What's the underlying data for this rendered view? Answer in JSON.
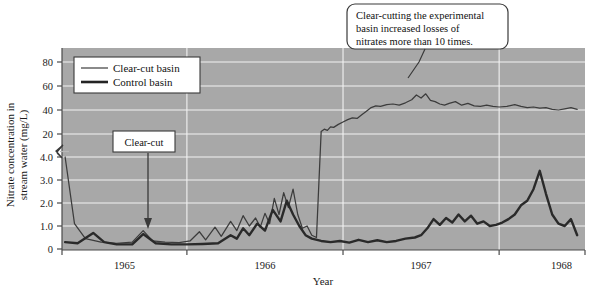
{
  "chart_data": {
    "type": "line",
    "title": "",
    "xlabel": "Year",
    "ylabel_line1": "Nitrate concentration in",
    "ylabel_line2": "stream water (mg/L)",
    "x_tick_labels": [
      "1965",
      "1966",
      "1967",
      "1968"
    ],
    "y_tick_labels_lower": [
      "0",
      "1.0",
      "2.0",
      "3.0",
      "4.0"
    ],
    "y_tick_labels_upper": [
      "20",
      "40",
      "60",
      "80"
    ],
    "y_axis_break": true,
    "y_axis_break_note": "broken axis: lower segment 0-4.0 mg/L, upper segment 20-80 mg/L",
    "grid": true,
    "legend_position": "upper-left-inside",
    "xlim_years": [
      1964.7,
      1968.05
    ],
    "series": [
      {
        "name": "Clear-cut basin",
        "style": "thin",
        "color": "#3c3c3c",
        "points": [
          [
            1964.72,
            4.0
          ],
          [
            1964.78,
            1.1
          ],
          [
            1964.85,
            0.45
          ],
          [
            1964.95,
            0.3
          ],
          [
            1965.05,
            0.25
          ],
          [
            1965.15,
            0.3
          ],
          [
            1965.22,
            0.8
          ],
          [
            1965.28,
            0.35
          ],
          [
            1965.36,
            0.3
          ],
          [
            1965.45,
            0.28
          ],
          [
            1965.52,
            0.35
          ],
          [
            1965.58,
            0.75
          ],
          [
            1965.62,
            0.4
          ],
          [
            1965.68,
            0.95
          ],
          [
            1965.72,
            0.55
          ],
          [
            1965.78,
            1.2
          ],
          [
            1965.82,
            0.8
          ],
          [
            1965.86,
            1.45
          ],
          [
            1965.9,
            1.0
          ],
          [
            1965.94,
            1.35
          ],
          [
            1965.97,
            0.95
          ],
          [
            1966.0,
            1.55
          ],
          [
            1966.03,
            1.1
          ],
          [
            1966.06,
            2.2
          ],
          [
            1966.09,
            1.5
          ],
          [
            1966.12,
            2.45
          ],
          [
            1966.15,
            1.8
          ],
          [
            1966.18,
            2.6
          ],
          [
            1966.21,
            1.5
          ],
          [
            1966.24,
            0.9
          ],
          [
            1966.27,
            1.0
          ],
          [
            1966.3,
            0.6
          ],
          [
            1966.33,
            0.5
          ],
          [
            1966.36,
            22.0
          ],
          [
            1966.38,
            24.0
          ],
          [
            1966.4,
            23.0
          ],
          [
            1966.42,
            26.0
          ],
          [
            1966.44,
            25.5
          ],
          [
            1966.47,
            28.0
          ],
          [
            1966.5,
            30.0
          ],
          [
            1966.53,
            32.0
          ],
          [
            1966.56,
            33.5
          ],
          [
            1966.59,
            33.0
          ],
          [
            1966.62,
            36.0
          ],
          [
            1966.65,
            39.0
          ],
          [
            1966.68,
            42.0
          ],
          [
            1966.71,
            43.5
          ],
          [
            1966.74,
            43.0
          ],
          [
            1966.78,
            44.5
          ],
          [
            1966.82,
            45.0
          ],
          [
            1966.86,
            44.0
          ],
          [
            1966.9,
            46.0
          ],
          [
            1966.94,
            48.5
          ],
          [
            1966.97,
            52.5
          ],
          [
            1967.0,
            50.0
          ],
          [
            1967.03,
            53.5
          ],
          [
            1967.06,
            48.0
          ],
          [
            1967.09,
            47.0
          ],
          [
            1967.12,
            45.0
          ],
          [
            1967.15,
            44.0
          ],
          [
            1967.18,
            45.5
          ],
          [
            1967.22,
            47.0
          ],
          [
            1967.26,
            44.0
          ],
          [
            1967.3,
            45.5
          ],
          [
            1967.34,
            43.5
          ],
          [
            1967.38,
            43.0
          ],
          [
            1967.42,
            44.0
          ],
          [
            1967.46,
            43.0
          ],
          [
            1967.5,
            42.5
          ],
          [
            1967.55,
            43.0
          ],
          [
            1967.6,
            44.5
          ],
          [
            1967.64,
            43.0
          ],
          [
            1967.68,
            42.0
          ],
          [
            1967.72,
            42.5
          ],
          [
            1967.76,
            41.5
          ],
          [
            1967.8,
            42.0
          ],
          [
            1967.84,
            40.5
          ],
          [
            1967.88,
            40.0
          ],
          [
            1967.92,
            41.0
          ],
          [
            1967.96,
            42.0
          ],
          [
            1968.0,
            40.5
          ]
        ]
      },
      {
        "name": "Control basin",
        "style": "thick",
        "color": "#2a2a2a",
        "points": [
          [
            1964.72,
            0.3
          ],
          [
            1964.8,
            0.25
          ],
          [
            1964.9,
            0.7
          ],
          [
            1964.97,
            0.3
          ],
          [
            1965.05,
            0.2
          ],
          [
            1965.15,
            0.2
          ],
          [
            1965.22,
            0.65
          ],
          [
            1965.3,
            0.25
          ],
          [
            1965.4,
            0.2
          ],
          [
            1965.5,
            0.2
          ],
          [
            1965.6,
            0.22
          ],
          [
            1965.7,
            0.25
          ],
          [
            1965.78,
            0.6
          ],
          [
            1965.82,
            0.45
          ],
          [
            1965.86,
            0.9
          ],
          [
            1965.9,
            0.6
          ],
          [
            1965.95,
            1.1
          ],
          [
            1966.0,
            0.8
          ],
          [
            1966.05,
            1.7
          ],
          [
            1966.1,
            1.2
          ],
          [
            1966.14,
            2.1
          ],
          [
            1966.18,
            1.5
          ],
          [
            1966.22,
            1.0
          ],
          [
            1966.26,
            0.6
          ],
          [
            1966.3,
            0.45
          ],
          [
            1966.36,
            0.35
          ],
          [
            1966.42,
            0.3
          ],
          [
            1966.48,
            0.35
          ],
          [
            1966.54,
            0.28
          ],
          [
            1966.6,
            0.4
          ],
          [
            1966.66,
            0.3
          ],
          [
            1966.72,
            0.38
          ],
          [
            1966.78,
            0.3
          ],
          [
            1966.84,
            0.35
          ],
          [
            1966.9,
            0.45
          ],
          [
            1966.96,
            0.5
          ],
          [
            1967.0,
            0.6
          ],
          [
            1967.04,
            0.9
          ],
          [
            1967.08,
            1.3
          ],
          [
            1967.12,
            1.05
          ],
          [
            1967.16,
            1.35
          ],
          [
            1967.2,
            1.15
          ],
          [
            1967.24,
            1.5
          ],
          [
            1967.28,
            1.2
          ],
          [
            1967.32,
            1.45
          ],
          [
            1967.36,
            1.1
          ],
          [
            1967.4,
            1.2
          ],
          [
            1967.44,
            1.0
          ],
          [
            1967.48,
            1.05
          ],
          [
            1967.52,
            1.15
          ],
          [
            1967.56,
            1.3
          ],
          [
            1967.6,
            1.5
          ],
          [
            1967.64,
            1.9
          ],
          [
            1967.68,
            2.1
          ],
          [
            1967.72,
            2.6
          ],
          [
            1967.76,
            3.4
          ],
          [
            1967.8,
            2.4
          ],
          [
            1967.84,
            1.5
          ],
          [
            1967.88,
            1.1
          ],
          [
            1967.92,
            1.0
          ],
          [
            1967.96,
            1.3
          ],
          [
            1968.0,
            0.6
          ]
        ]
      }
    ],
    "annotations": [
      {
        "id": "clear-cut-marker",
        "label": "Clear-cut",
        "at_year": 1965.3,
        "type": "arrow-box"
      },
      {
        "id": "clear-cut-explanation",
        "line1": "Clear-cutting the experimental",
        "line2": "basin increased losses of",
        "line3": "nitrates more than 10 times.",
        "type": "callout-box"
      }
    ]
  },
  "legend": {
    "items": [
      {
        "label": "Clear-cut basin",
        "style": "thin"
      },
      {
        "label": "Control basin",
        "style": "thick"
      }
    ]
  },
  "colors": {
    "plot_background": "#a8a8a8",
    "gridline": "#f0f0f0",
    "axis": "#4a4a4a",
    "page_background": "#ffffff",
    "clear_cut_line": "#3c3c3c",
    "control_line": "#242424"
  }
}
